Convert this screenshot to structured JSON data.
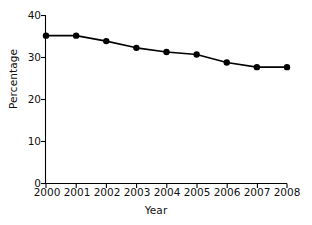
{
  "chart_data": {
    "type": "line",
    "title": "",
    "xlabel": "Year",
    "ylabel": "Percentage",
    "categories": [
      "2000",
      "2001",
      "2002",
      "2003",
      "2004",
      "2005",
      "2006",
      "2007",
      "2008"
    ],
    "x": [
      2000,
      2001,
      2002,
      2003,
      2004,
      2005,
      2006,
      2007,
      2008
    ],
    "values": [
      35.2,
      35.2,
      33.9,
      32.3,
      31.3,
      30.7,
      28.8,
      27.7,
      27.7
    ],
    "series": [
      {
        "name": "Percentage",
        "values": [
          35.2,
          35.2,
          33.9,
          32.3,
          31.3,
          30.7,
          28.8,
          27.7,
          27.7
        ]
      }
    ],
    "ylim": [
      0,
      40
    ],
    "xlim": [
      2000,
      2008
    ],
    "yticks": [
      0,
      10,
      20,
      30,
      40
    ],
    "ytick_labels": [
      "0",
      "10",
      "20",
      "30",
      "40"
    ],
    "xticks": [
      2000,
      2001,
      2002,
      2003,
      2004,
      2005,
      2006,
      2007,
      2008
    ],
    "xtick_labels": [
      "2000",
      "2001",
      "2002",
      "2003",
      "2004",
      "2005",
      "2006",
      "2007",
      "2008"
    ],
    "grid": false,
    "legend": false,
    "legend_position": "none",
    "marker": "filled-circle",
    "line_color": "#000000",
    "marker_color": "#000000",
    "axis_color": "#000000",
    "background_color": "#ffffff"
  }
}
